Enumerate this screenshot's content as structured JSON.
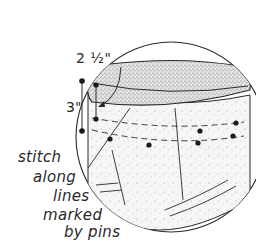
{
  "figure": {
    "colors": {
      "line": "#2a2a2a",
      "fill_band": "#d6d6d6",
      "fill_body": "#f1f1f1",
      "background": "#ffffff"
    }
  },
  "dimensions": {
    "top": "2 ½\"",
    "side": "3\""
  },
  "caption": {
    "lines": [
      "stitch",
      "along",
      "lines",
      "marked",
      "by pins"
    ]
  }
}
